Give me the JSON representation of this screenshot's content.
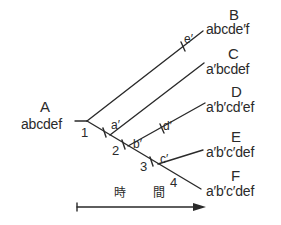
{
  "diagram": {
    "type": "phylogenetic-tree",
    "line_color": "#2a2a2a",
    "root": {
      "letter": "A",
      "sequence": "abcdef"
    },
    "leaves": [
      {
        "letter": "B",
        "sequence": "abcde′f"
      },
      {
        "letter": "C",
        "sequence": "a′bcdef"
      },
      {
        "letter": "D",
        "sequence": "a′b′cd′ef"
      },
      {
        "letter": "E",
        "sequence": "a′b′c′def"
      },
      {
        "letter": "F",
        "sequence": "a′b′c′def"
      }
    ],
    "branch_points": [
      "1",
      "2",
      "3",
      "4"
    ],
    "mutations": [
      "a′",
      "b′",
      "c′",
      "d′",
      "e′"
    ],
    "time_axis": {
      "label_left": "時",
      "label_right": "間",
      "arrow-icon": "right-arrow"
    }
  }
}
